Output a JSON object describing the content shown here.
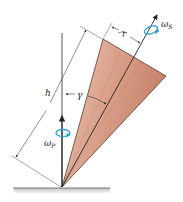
{
  "figure": {
    "type": "diagram",
    "labels": {
      "h": "h",
      "r": "r",
      "gamma": "γ",
      "omega_s": "ω",
      "omega_s_sub": "S",
      "omega_p": "ω",
      "omega_p_sub": "P"
    },
    "colors": {
      "cone_fill_light": "#e8b8a4",
      "cone_fill_dark": "#c98a74",
      "cone_edge": "#5a3a30",
      "line": "#333333",
      "rotation_arrow": "#2a9fd0",
      "ground": "#7a7a7a",
      "ground_shadow": "#c8cfc8"
    },
    "elements": [
      {
        "name": "cone",
        "description": "cone tilted at angle γ from vertical, apex on ground"
      },
      {
        "name": "spin-axis",
        "description": "cone axis with arrow and spin rotation ω_S"
      },
      {
        "name": "precession-axis",
        "description": "vertical axis with arrow and rotation ω_P"
      },
      {
        "name": "dimension-h",
        "description": "slant height along cone side"
      },
      {
        "name": "dimension-r",
        "description": "base radius"
      },
      {
        "name": "angle-gamma",
        "description": "half-angle between cone side and axis"
      },
      {
        "name": "ground",
        "description": "horizontal ground surface"
      }
    ]
  }
}
